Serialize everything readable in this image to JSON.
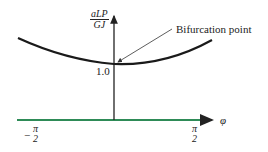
{
  "figure": {
    "y_axis_label": {
      "numerator": "aLP",
      "denominator": "GJ"
    },
    "x_axis_label": "φ",
    "annotation": "Bifurcation point",
    "y_tick": "1.0",
    "x_ticks": [
      {
        "sign": "−",
        "numerator": "π",
        "denominator": "2"
      },
      {
        "sign": "",
        "numerator": "π",
        "denominator": "2"
      }
    ],
    "colors": {
      "curve": "#1a1a1a",
      "x_axis": "#2e8b57",
      "axis": "#222222"
    }
  }
}
